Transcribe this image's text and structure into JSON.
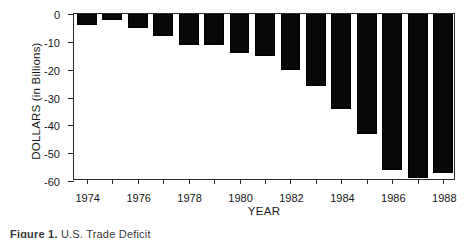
{
  "chart_data": {
    "type": "bar",
    "title": "",
    "xlabel": "YEAR",
    "ylabel": "DOLLARS (in Billions)",
    "categories": [
      1974,
      1975,
      1976,
      1977,
      1978,
      1979,
      1980,
      1981,
      1982,
      1983,
      1984,
      1985,
      1986,
      1987,
      1988
    ],
    "values": [
      -4,
      -2,
      -5,
      -8,
      -11,
      -11,
      -14,
      -15,
      -20,
      -26,
      -34,
      -43,
      -56,
      -59,
      -57
    ],
    "xtick_labels": [
      "1974",
      "",
      "1976",
      "",
      "1978",
      "",
      "1980",
      "",
      "1982",
      "",
      "1984",
      "",
      "1986",
      "",
      "1988"
    ],
    "ytick_values": [
      0,
      -10,
      -20,
      -30,
      -40,
      -50,
      -60
    ],
    "ytick_labels": [
      "0",
      "-10",
      "-20",
      "-30",
      "-40",
      "-50",
      "-60"
    ],
    "ylim": [
      -60,
      0
    ],
    "xlim": [
      1973.5,
      1988.5
    ],
    "grid": false,
    "legend": false,
    "bar_color": "#080808",
    "axis_color": "#2b2b2b"
  },
  "caption": {
    "lead": "Figure 1.",
    "text": "U.S. Trade Deficit"
  }
}
